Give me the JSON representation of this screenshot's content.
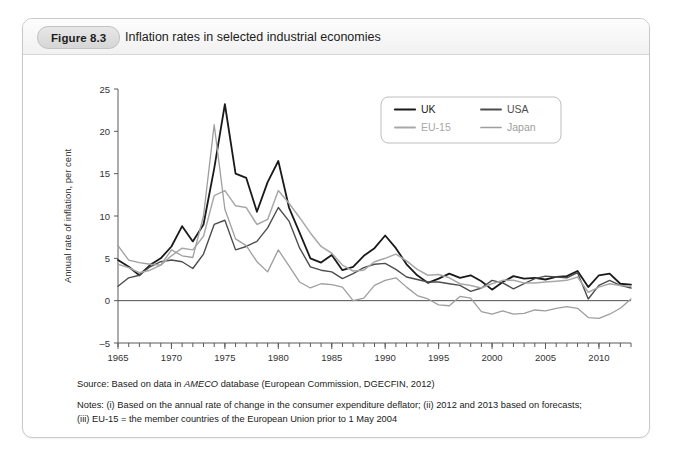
{
  "figure": {
    "badge": "Figure 8.3",
    "title": "Inflation rates in selected industrial economies"
  },
  "notes": {
    "source_prefix": "Source: Based on data in ",
    "source_italic": "AMECO",
    "source_suffix": " database (European Commission, DGECFIN, 2012)",
    "note_line1": "Notes: (i) Based on the annual rate of change in the consumer expenditure deflator; (ii) 2012 and 2013 based on forecasts;",
    "note_line2": "(iii) EU-15 = the member countries of the European Union prior to 1 May 2004"
  },
  "chart_data": {
    "type": "line",
    "title": "Inflation rates in selected industrial economies",
    "xlabel": "",
    "ylabel": "Annual rate of inflation, per cent",
    "xlim": [
      1965,
      2013
    ],
    "ylim": [
      -5,
      25
    ],
    "yticks": [
      -5,
      0,
      5,
      10,
      15,
      20,
      25
    ],
    "xticks": [
      1965,
      1970,
      1975,
      1980,
      1985,
      1990,
      1995,
      2000,
      2005,
      2010
    ],
    "x_minor_step": 1,
    "grid": false,
    "zero_line": true,
    "legend_position": "top-right",
    "x": [
      1965,
      1966,
      1967,
      1968,
      1969,
      1970,
      1971,
      1972,
      1973,
      1974,
      1975,
      1976,
      1977,
      1978,
      1979,
      1980,
      1981,
      1982,
      1983,
      1984,
      1985,
      1986,
      1987,
      1988,
      1989,
      1990,
      1991,
      1992,
      1993,
      1994,
      1995,
      1996,
      1997,
      1998,
      1999,
      2000,
      2001,
      2002,
      2003,
      2004,
      2005,
      2006,
      2007,
      2008,
      2009,
      2010,
      2011,
      2012,
      2013
    ],
    "series": [
      {
        "name": "UK",
        "color": "#1a1a1a",
        "width": 1.8,
        "values": [
          4.8,
          4.0,
          3.0,
          4.2,
          5.0,
          6.4,
          8.8,
          7.0,
          9.0,
          15.6,
          23.2,
          15.0,
          14.5,
          10.5,
          14.0,
          16.5,
          11.0,
          8.0,
          5.0,
          4.5,
          5.4,
          3.6,
          4.0,
          5.3,
          6.2,
          7.7,
          6.2,
          4.3,
          3.0,
          2.1,
          2.6,
          3.2,
          2.7,
          3.0,
          2.3,
          1.3,
          2.2,
          2.9,
          2.6,
          2.7,
          2.5,
          2.8,
          2.9,
          3.5,
          1.6,
          3.0,
          3.2,
          2.0,
          1.9
        ]
      },
      {
        "name": "USA",
        "color": "#4d4d4d",
        "width": 1.4,
        "values": [
          1.7,
          2.7,
          3.0,
          4.0,
          4.6,
          4.8,
          4.6,
          3.8,
          5.5,
          9.0,
          9.5,
          6.0,
          6.4,
          7.0,
          8.6,
          11.0,
          9.4,
          6.2,
          4.0,
          3.6,
          3.4,
          2.6,
          3.2,
          3.9,
          4.3,
          4.4,
          3.7,
          2.8,
          2.5,
          2.2,
          2.2,
          2.0,
          1.8,
          1.1,
          1.5,
          2.4,
          2.1,
          1.4,
          2.0,
          2.6,
          2.9,
          2.8,
          2.7,
          3.3,
          0.2,
          1.8,
          2.4,
          1.8,
          1.5
        ]
      },
      {
        "name": "EU-15",
        "color": "#a8a8a8",
        "width": 1.5,
        "values": [
          4.3,
          3.9,
          3.3,
          3.6,
          4.2,
          5.3,
          6.2,
          6.0,
          7.6,
          12.4,
          13.0,
          11.2,
          11.0,
          9.0,
          9.6,
          13.0,
          11.5,
          9.8,
          8.0,
          6.4,
          5.6,
          4.2,
          3.5,
          3.6,
          4.6,
          5.0,
          5.5,
          4.7,
          3.7,
          3.0,
          3.1,
          2.7,
          2.0,
          1.8,
          1.5,
          2.0,
          2.4,
          2.4,
          2.1,
          2.1,
          2.2,
          2.3,
          2.4,
          2.8,
          1.0,
          1.6,
          2.0,
          1.8,
          1.7
        ]
      },
      {
        "name": "Japan",
        "color": "#9e9e9e",
        "width": 1.3,
        "values": [
          6.5,
          4.8,
          4.5,
          4.3,
          4.2,
          6.0,
          5.3,
          5.1,
          10.0,
          20.8,
          10.8,
          7.3,
          6.5,
          4.6,
          3.4,
          6.0,
          4.1,
          2.2,
          1.5,
          2.0,
          1.9,
          1.6,
          0.0,
          0.3,
          1.8,
          2.4,
          2.7,
          1.6,
          0.6,
          0.2,
          -0.5,
          -0.6,
          0.5,
          0.3,
          -1.3,
          -1.6,
          -1.2,
          -1.6,
          -1.5,
          -1.1,
          -1.2,
          -0.9,
          -0.7,
          -0.9,
          -2.0,
          -2.1,
          -1.6,
          -0.9,
          0.2
        ]
      }
    ]
  }
}
